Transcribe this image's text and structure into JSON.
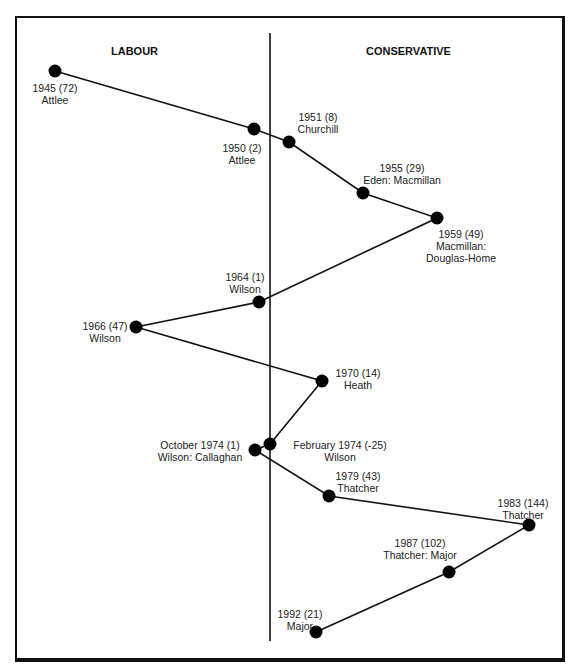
{
  "headers": {
    "left": "LABOUR",
    "right": "CONSERVATIVE"
  },
  "colors": {
    "line": "#111111",
    "dot": "#000000",
    "text": "#222222"
  },
  "chart_data": {
    "type": "line",
    "title": "",
    "xlabel": "",
    "ylabel": "",
    "divider": "vertical line separating Labour (left) and Conservative (right)",
    "points": [
      {
        "label": "1945",
        "majority": "72",
        "leader": "Attlee",
        "party": "Labour",
        "x": 55,
        "y": 71
      },
      {
        "label": "1950",
        "majority": "2",
        "leader": "Attlee",
        "party": "Labour",
        "x": 254,
        "y": 129
      },
      {
        "label": "1951",
        "majority": "8",
        "leader": "Churchill",
        "party": "Conservative",
        "x": 289,
        "y": 142
      },
      {
        "label": "1955",
        "majority": "29",
        "leader": "Eden: Macmillan",
        "party": "Conservative",
        "x": 363,
        "y": 193
      },
      {
        "label": "1959",
        "majority": "49",
        "leader": "Macmillan: Douglas-Home",
        "party": "Conservative",
        "x": 437,
        "y": 218
      },
      {
        "label": "1964",
        "majority": "1",
        "leader": "Wilson",
        "party": "Labour",
        "x": 259,
        "y": 302
      },
      {
        "label": "1966",
        "majority": "47",
        "leader": "Wilson",
        "party": "Labour",
        "x": 136,
        "y": 327
      },
      {
        "label": "1970",
        "majority": "14",
        "leader": "Heath",
        "party": "Conservative",
        "x": 322,
        "y": 381
      },
      {
        "label": "February 1974",
        "majority": "-25",
        "leader": "Wilson",
        "party": "Labour (minority)",
        "x": 270,
        "y": 444
      },
      {
        "label": "October 1974",
        "majority": "1",
        "leader": "Wilson: Callaghan",
        "party": "Labour",
        "x": 255,
        "y": 450
      },
      {
        "label": "1979",
        "majority": "43",
        "leader": "Thatcher",
        "party": "Conservative",
        "x": 329,
        "y": 496
      },
      {
        "label": "1983",
        "majority": "144",
        "leader": "Thatcher",
        "party": "Conservative",
        "x": 529,
        "y": 525
      },
      {
        "label": "1987",
        "majority": "102",
        "leader": "Thatcher: Major",
        "party": "Conservative",
        "x": 449,
        "y": 572
      },
      {
        "label": "1992",
        "majority": "21",
        "leader": "Major",
        "party": "Conservative",
        "x": 316,
        "y": 632
      }
    ]
  },
  "labels": [
    {
      "line1": "1945  (72)",
      "line2": "Attlee",
      "left": 20,
      "top": 82,
      "w": 70
    },
    {
      "line1": "1950  (2)",
      "line2": "Attlee",
      "left": 212,
      "top": 142,
      "w": 60
    },
    {
      "line1": "1951  (8)",
      "line2": "Churchill",
      "left": 288,
      "top": 111,
      "w": 60
    },
    {
      "line1": "1955  (29)",
      "line2": "Eden: Macmillan",
      "left": 352,
      "top": 162,
      "w": 100
    },
    {
      "line1": "1959  (49)",
      "line2": "Macmillan:",
      "line3": "Douglas-Home",
      "left": 416,
      "top": 228,
      "w": 90
    },
    {
      "line1": "1964 (1)",
      "line2": "Wilson",
      "left": 215,
      "top": 271,
      "w": 60
    },
    {
      "line1": "1966 (47)",
      "line2": "Wilson",
      "left": 75,
      "top": 320,
      "w": 60
    },
    {
      "line1": "1970  (14)",
      "line2": "Heath",
      "left": 322,
      "top": 367,
      "w": 72
    },
    {
      "line1": "February 1974  (-25)",
      "line2": "Wilson",
      "left": 280,
      "top": 439,
      "w": 120
    },
    {
      "line1": "October 1974  (1)",
      "line2": "Wilson: Callaghan",
      "left": 150,
      "top": 439,
      "w": 100
    },
    {
      "line1": "1979  (43)",
      "line2": "Thatcher",
      "left": 308,
      "top": 470,
      "w": 100
    },
    {
      "line1": "1983  (144)",
      "line2": "Thatcher",
      "left": 488,
      "top": 497,
      "w": 70
    },
    {
      "line1": "1987  (102)",
      "line2": "Thatcher: Major",
      "left": 375,
      "top": 537,
      "w": 90
    },
    {
      "line1": "1992  (21)",
      "line2": "Major",
      "left": 270,
      "top": 608,
      "w": 60
    }
  ]
}
